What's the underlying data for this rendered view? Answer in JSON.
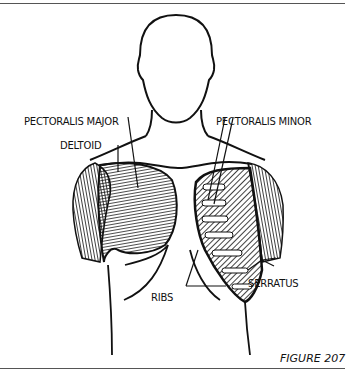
{
  "figure": {
    "caption": "FIGURE 207",
    "labels": {
      "pectoralis_major": "PECTORALIS MAJOR",
      "pectoralis_minor": "PECTORALIS MINOR",
      "deltoid": "DELTOID",
      "ribs": "RIBS",
      "serratus": "SERRATUS"
    },
    "colors": {
      "ink": "#111111",
      "paper": "#ffffff",
      "rule": "#555555"
    }
  }
}
